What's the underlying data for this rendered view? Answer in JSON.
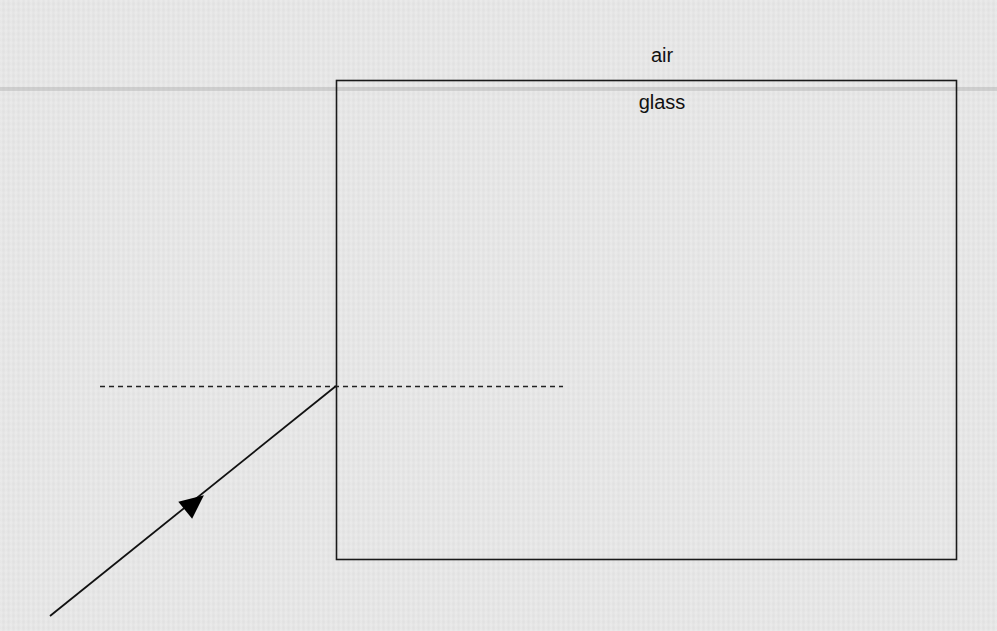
{
  "diagram": {
    "labels": {
      "upper_medium": "air",
      "lower_medium": "glass"
    },
    "glass_block": {
      "x": 336,
      "y": 80,
      "width": 620,
      "height": 479,
      "stroke": "#1a1a1a"
    },
    "normal_line": {
      "x1": 100,
      "y1": 386,
      "x2": 563,
      "y2": 386,
      "style": "dashed"
    },
    "incident_ray": {
      "x1": 50,
      "y1": 616,
      "x2": 336,
      "y2": 386,
      "arrow_direction": "toward-block",
      "arrow_position": {
        "x": 195,
        "y": 503
      }
    },
    "colors": {
      "background": "#e7e7e7",
      "ink": "#111111"
    }
  }
}
